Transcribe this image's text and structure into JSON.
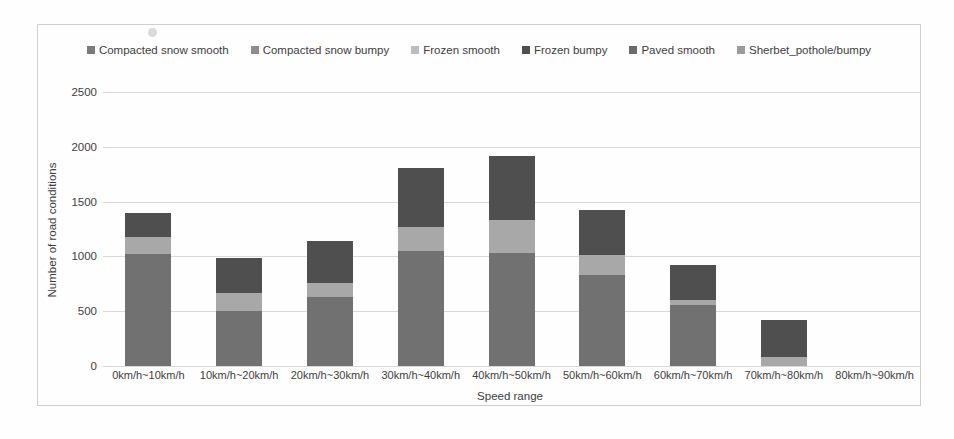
{
  "chart_data": {
    "type": "bar",
    "stacked": true,
    "title": "",
    "xlabel": "Speed range",
    "ylabel": "Number of road conditions",
    "ylim": [
      0,
      2500
    ],
    "yticks": [
      0,
      500,
      1000,
      1500,
      2000,
      2500
    ],
    "ytick_labels": [
      "0",
      "500",
      "1000",
      "1500",
      "2000",
      "2500"
    ],
    "grid": true,
    "legend_position": "top-center",
    "categories": [
      "0km/h~10km/h",
      "10km/h~20km/h",
      "20km/h~30km/h",
      "30km/h~40km/h",
      "40km/h~50km/h",
      "50km/h~60km/h",
      "60km/h~70km/h",
      "70km/h~80km/h",
      "80km/h~90km/h"
    ],
    "series": [
      {
        "name": "Compacted snow smooth",
        "color": "#7a7a7a",
        "values": [
          0,
          0,
          0,
          0,
          0,
          0,
          0,
          0,
          0
        ]
      },
      {
        "name": "Compacted snow bumpy",
        "color": "#9a9a9a",
        "values": [
          0,
          0,
          0,
          0,
          0,
          0,
          0,
          0,
          0
        ]
      },
      {
        "name": "Frozen smooth",
        "color": "#bdbdbd",
        "values": [
          0,
          0,
          0,
          0,
          0,
          0,
          0,
          0,
          0
        ]
      },
      {
        "name": "Frozen bumpy",
        "color": "#6f6f6f",
        "values": [
          0,
          0,
          0,
          0,
          0,
          0,
          0,
          0,
          0
        ]
      },
      {
        "name": "Paved smooth",
        "color": "#717171",
        "values": [
          1020,
          500,
          630,
          1050,
          1030,
          830,
          560,
          0,
          0
        ]
      },
      {
        "name": "Sherbet_pothole/bumpy",
        "color": "#a8a8a8",
        "values": [
          155,
          165,
          130,
          215,
          300,
          180,
          45,
          80,
          0
        ]
      }
    ],
    "top_segment": {
      "name": "Frozen bumpy",
      "color": "#4f4f4f",
      "values": [
        225,
        325,
        380,
        545,
        590,
        410,
        315,
        340,
        0
      ]
    },
    "totals": [
      1400,
      990,
      1140,
      1810,
      1920,
      1420,
      920,
      420,
      0
    ]
  },
  "legend": {
    "items": [
      {
        "label": "Compacted snow smooth",
        "color": "#7a7a7a"
      },
      {
        "label": "Compacted snow bumpy",
        "color": "#8d8d8d"
      },
      {
        "label": "Frozen smooth",
        "color": "#bdbdbd"
      },
      {
        "label": "Frozen bumpy",
        "color": "#4f4f4f"
      },
      {
        "label": "Paved smooth",
        "color": "#6b6b6b"
      },
      {
        "label": "Sherbet_pothole/bumpy",
        "color": "#9c9c9c"
      }
    ]
  },
  "axes": {
    "y_title": "Number of road conditions",
    "x_title": "Speed range"
  },
  "colors": {
    "gridline": "#d8d8d8",
    "border": "#cfcfcf",
    "text": "#3d3d3d",
    "background": "#ffffff"
  }
}
